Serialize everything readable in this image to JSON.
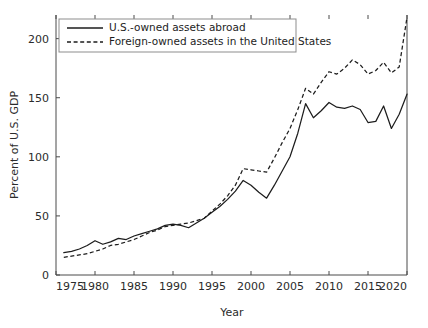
{
  "chart_data": {
    "type": "line",
    "title": "",
    "xlabel": "Year",
    "ylabel": "Percent of U.S. GDP",
    "xlim": [
      1975,
      2020
    ],
    "ylim": [
      0,
      220
    ],
    "xticks": [
      1975,
      1980,
      1985,
      1990,
      1995,
      2000,
      2005,
      2010,
      2015,
      2020
    ],
    "yticks": [
      0,
      50,
      100,
      150,
      200
    ],
    "xtick_labels": [
      "1975",
      "1980",
      "1985",
      "1990",
      "1995",
      "2000",
      "2005",
      "2010",
      "2015",
      "2020"
    ],
    "ytick_labels": [
      "0",
      "50",
      "100",
      "150",
      "200"
    ],
    "grid": false,
    "legend_position": "upper-left",
    "x": [
      1976,
      1977,
      1978,
      1979,
      1980,
      1981,
      1982,
      1983,
      1984,
      1985,
      1986,
      1987,
      1988,
      1989,
      1990,
      1991,
      1992,
      1993,
      1994,
      1995,
      1996,
      1997,
      1998,
      1999,
      2000,
      2001,
      2002,
      2003,
      2004,
      2005,
      2006,
      2007,
      2008,
      2009,
      2010,
      2011,
      2012,
      2013,
      2014,
      2015,
      2016,
      2017,
      2018,
      2019,
      2020
    ],
    "series": [
      {
        "name": "U.S.-owned assets abroad",
        "style": "solid",
        "color": "#1d1d1d",
        "values": [
          19,
          20,
          22,
          25,
          29,
          26,
          28,
          31,
          30,
          33,
          35,
          37,
          39,
          42,
          43,
          42,
          40,
          44,
          48,
          53,
          58,
          64,
          71,
          80,
          76,
          70,
          65,
          76,
          88,
          100,
          120,
          145,
          133,
          139,
          146,
          142,
          141,
          143,
          140,
          129,
          130,
          143,
          124,
          136,
          153
        ]
      },
      {
        "name": "Foreign-owned assets in the United States",
        "style": "dashed",
        "color": "#1d1d1d",
        "values": [
          15,
          16,
          17,
          18,
          20,
          22,
          25,
          26,
          28,
          30,
          33,
          36,
          38,
          41,
          42,
          43,
          44,
          46,
          48,
          54,
          60,
          67,
          76,
          90,
          89,
          88,
          87,
          99,
          112,
          124,
          140,
          158,
          153,
          163,
          172,
          170,
          175,
          182,
          178,
          170,
          173,
          180,
          171,
          176,
          218
        ]
      }
    ]
  },
  "legend": {
    "entries": [
      {
        "label": "U.S.-owned assets abroad",
        "style": "solid"
      },
      {
        "label": "Foreign-owned assets in the United States",
        "style": "dashed"
      }
    ]
  },
  "axes": {
    "x_title": "Year",
    "y_title": "Percent of U.S. GDP"
  }
}
